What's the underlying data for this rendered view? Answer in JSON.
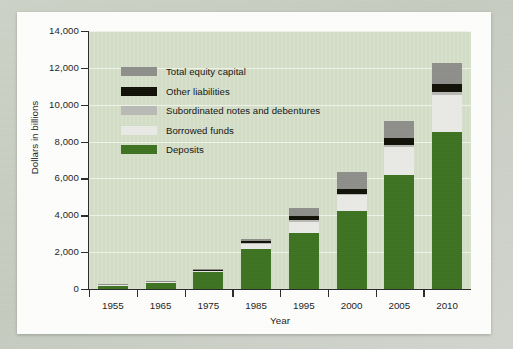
{
  "chart_data": {
    "type": "bar",
    "subtype": "stacked-bar",
    "title": "",
    "xlabel": "Year",
    "ylabel": "Dollars in billions",
    "categories": [
      "1955",
      "1965",
      "1975",
      "1985",
      "1995",
      "2000",
      "2005",
      "2010"
    ],
    "ylim": [
      0,
      14000
    ],
    "ytick_labels": [
      "0",
      "2,000",
      "4,000",
      "6,000",
      "8,000",
      "10,000",
      "12,000",
      "14,000"
    ],
    "ytick_values": [
      0,
      2000,
      4000,
      6000,
      8000,
      10000,
      12000,
      14000
    ],
    "grid": true,
    "grid_axis": "y",
    "legend_position": "upper-left-inside",
    "series": [
      {
        "name": "Deposits",
        "color": "#3d7321",
        "values": [
          210,
          375,
          950,
          2150,
          3050,
          4250,
          6200,
          8500
        ]
      },
      {
        "name": "Borrowed funds",
        "color": "#e9e9e6",
        "values": [
          25,
          25,
          60,
          330,
          620,
          850,
          1520,
          2050
        ]
      },
      {
        "name": "Subordinated notes and debentures",
        "color": "#b9b9b6",
        "values": [
          0,
          0,
          10,
          20,
          50,
          80,
          120,
          160
        ]
      },
      {
        "name": "Other liabilities",
        "color": "#111108",
        "values": [
          0,
          0,
          10,
          100,
          230,
          270,
          380,
          390
        ]
      },
      {
        "name": "Total equity capital",
        "color": "#8e8e8b",
        "values": [
          20,
          25,
          60,
          110,
          420,
          900,
          900,
          1150
        ]
      }
    ],
    "totals": [
      255,
      425,
      1090,
      2710,
      4370,
      6350,
      9120,
      12250
    ]
  },
  "legend": {
    "entries": [
      {
        "label": "Total equity capital",
        "color": "#8e8e8b"
      },
      {
        "label": "Other liabilities",
        "color": "#111108"
      },
      {
        "label": "Subordinated notes and debentures",
        "color": "#b9b9b6"
      },
      {
        "label": "Borrowed funds",
        "color": "#e9e9e6"
      },
      {
        "label": "Deposits",
        "color": "#3d7321"
      }
    ]
  },
  "colors": {
    "plot_background": "#d5dfc8",
    "page_background": "#fdfdfc",
    "outer_background": "#c9cdc4",
    "gridline": "#f2f6ec",
    "axis": "#2b2b2b",
    "text": "#1d1d1d"
  }
}
